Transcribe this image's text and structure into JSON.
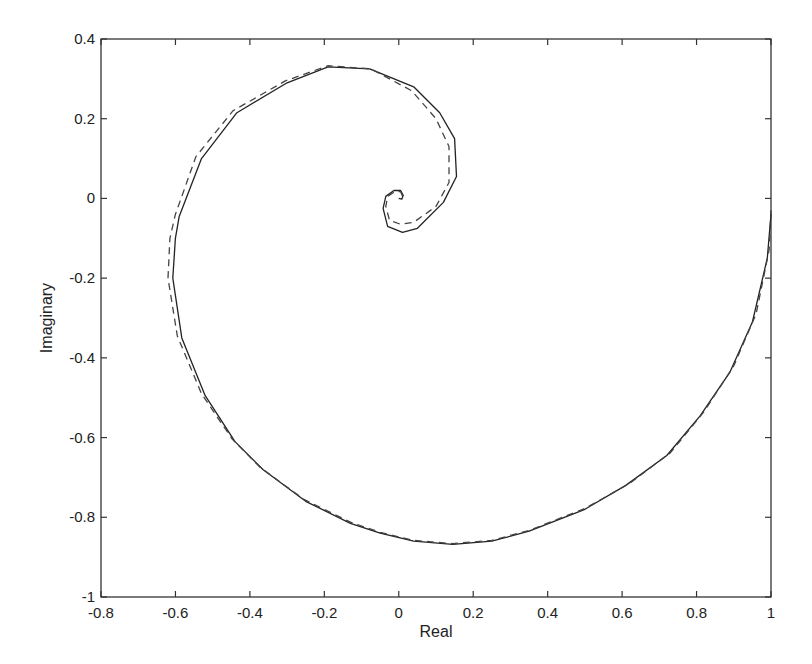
{
  "chart_data": {
    "type": "line",
    "title": "",
    "xlabel": "Real",
    "ylabel": "Imaginary",
    "xlim": [
      -0.8,
      1
    ],
    "ylim": [
      -1,
      0.4
    ],
    "grid": false,
    "legend": null,
    "xticks": [
      -0.8,
      -0.6,
      -0.4,
      -0.2,
      0,
      0.2,
      0.4,
      0.6,
      0.8,
      1
    ],
    "xtick_labels": [
      "-0.8",
      "-0.6",
      "-0.4",
      "-0.2",
      "0",
      "0.2",
      "0.4",
      "0.6",
      "0.8",
      "1"
    ],
    "yticks": [
      -1,
      -0.8,
      -0.6,
      -0.4,
      -0.2,
      0,
      0.2,
      0.4
    ],
    "ytick_labels": [
      "-1",
      "-0.8",
      "-0.6",
      "-0.4",
      "-0.2",
      "0",
      "0.2",
      "0.4"
    ],
    "series": [
      {
        "name": "solid",
        "style": "solid",
        "color": "#222222",
        "x": [
          1.0,
          0.99,
          0.95,
          0.89,
          0.81,
          0.72,
          0.61,
          0.5,
          0.35,
          0.25,
          0.145,
          0.04,
          -0.05,
          -0.13,
          -0.25,
          -0.365,
          -0.44,
          -0.52,
          -0.583,
          -0.607,
          -0.6,
          -0.59,
          -0.53,
          -0.435,
          -0.3,
          -0.19,
          -0.078,
          0.04,
          0.11,
          0.15,
          0.155,
          0.12,
          0.05,
          0.01,
          -0.03,
          -0.042,
          -0.035,
          -0.013,
          0.005,
          0.012,
          0.008,
          0.0
        ],
        "y": [
          -0.04,
          -0.15,
          -0.31,
          -0.435,
          -0.545,
          -0.645,
          -0.72,
          -0.78,
          -0.835,
          -0.86,
          -0.868,
          -0.86,
          -0.84,
          -0.815,
          -0.76,
          -0.68,
          -0.61,
          -0.495,
          -0.35,
          -0.2,
          -0.1,
          -0.045,
          0.1,
          0.215,
          0.29,
          0.33,
          0.325,
          0.28,
          0.215,
          0.15,
          0.055,
          -0.01,
          -0.075,
          -0.085,
          -0.07,
          -0.025,
          0.005,
          0.02,
          0.02,
          0.008,
          -0.002,
          0.0
        ]
      },
      {
        "name": "dashed",
        "style": "dashed",
        "color": "#444444",
        "x": [
          1.0,
          0.995,
          0.96,
          0.9,
          0.82,
          0.73,
          0.62,
          0.5,
          0.35,
          0.25,
          0.145,
          0.04,
          -0.05,
          -0.13,
          -0.255,
          -0.372,
          -0.448,
          -0.53,
          -0.595,
          -0.62,
          -0.615,
          -0.6,
          -0.545,
          -0.445,
          -0.305,
          -0.19,
          -0.075,
          0.035,
          0.1,
          0.135,
          0.135,
          0.1,
          0.04,
          0.005,
          -0.025,
          -0.035,
          -0.03,
          -0.01,
          0.005,
          0.01,
          0.006,
          0.0
        ],
        "y": [
          -0.03,
          -0.13,
          -0.29,
          -0.42,
          -0.535,
          -0.638,
          -0.715,
          -0.778,
          -0.833,
          -0.858,
          -0.866,
          -0.858,
          -0.838,
          -0.812,
          -0.755,
          -0.675,
          -0.603,
          -0.49,
          -0.345,
          -0.2,
          -0.1,
          -0.04,
          0.105,
          0.22,
          0.295,
          0.333,
          0.325,
          0.27,
          0.2,
          0.13,
          0.04,
          -0.02,
          -0.06,
          -0.065,
          -0.055,
          -0.02,
          0.005,
          0.018,
          0.017,
          0.006,
          -0.002,
          0.0
        ]
      }
    ]
  }
}
